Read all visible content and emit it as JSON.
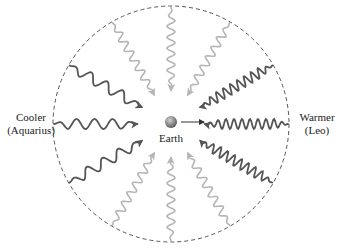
{
  "labels": {
    "earth": "Earth",
    "left_line1": "Cooler",
    "left_line2": "(Aquarius)",
    "right_line1": "Warmer",
    "right_line2": "(Leo)"
  },
  "colors": {
    "circle": "#555555",
    "dark_wave": "#555555",
    "mid_wave": "#8a8a8a",
    "light_wave": "#b5b5b5",
    "earth_fill": "#8c8c8c",
    "earth_arrow": "#333333"
  },
  "waves": [
    {
      "angle_deg": 180,
      "shade": "dark",
      "wavelength": "long"
    },
    {
      "angle_deg": 150,
      "shade": "dark",
      "wavelength": "long"
    },
    {
      "angle_deg": 210,
      "shade": "dark",
      "wavelength": "long"
    },
    {
      "angle_deg": 0,
      "shade": "dark",
      "wavelength": "short"
    },
    {
      "angle_deg": 30,
      "shade": "dark",
      "wavelength": "short"
    },
    {
      "angle_deg": 330,
      "shade": "dark",
      "wavelength": "short"
    },
    {
      "angle_deg": 120,
      "shade": "light",
      "wavelength": "medium"
    },
    {
      "angle_deg": 90,
      "shade": "light",
      "wavelength": "medium"
    },
    {
      "angle_deg": 60,
      "shade": "light",
      "wavelength": "medium"
    },
    {
      "angle_deg": 240,
      "shade": "light",
      "wavelength": "medium"
    },
    {
      "angle_deg": 270,
      "shade": "light",
      "wavelength": "medium"
    },
    {
      "angle_deg": 300,
      "shade": "light",
      "wavelength": "medium"
    }
  ]
}
